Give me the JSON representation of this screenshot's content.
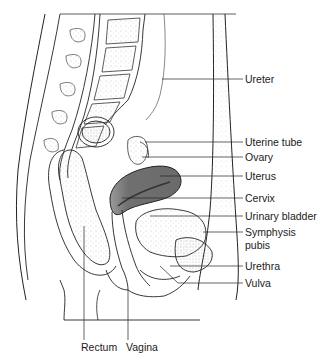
{
  "diagram": {
    "type": "anatomical-sagittal-section",
    "colors": {
      "line": "#1a1a1a",
      "uterus_fill": "#6e6e6e",
      "stipple": "#9a9a9a",
      "background": "#ffffff"
    },
    "labels": {
      "ureter": "Ureter",
      "uterine_tube": "Uterine tube",
      "ovary": "Ovary",
      "uterus": "Uterus",
      "cervix": "Cervix",
      "urinary_bladder": "Urinary bladder",
      "symphysis_pubis_1": "Symphysis",
      "symphysis_pubis_2": "pubis",
      "urethra": "Urethra",
      "vulva": "Vulva",
      "rectum": "Rectum",
      "vagina": "Vagina"
    }
  }
}
